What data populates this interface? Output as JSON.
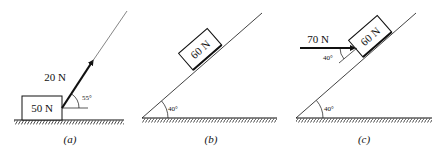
{
  "panels": [
    {
      "id": "a",
      "caption": "(a)",
      "block_weight": "50 N",
      "force_label": "20 N",
      "force_angle_label": "55°",
      "force_angle_deg": 55
    },
    {
      "id": "b",
      "caption": "(b)",
      "block_weight": "60 N",
      "incline_angle_label": "40°",
      "incline_angle_deg": 40
    },
    {
      "id": "c",
      "caption": "(c)",
      "block_weight": "60 N",
      "force_label": "70 N",
      "force_angle_label": "40°",
      "incline_angle_label": "40°",
      "incline_angle_deg": 40
    }
  ]
}
